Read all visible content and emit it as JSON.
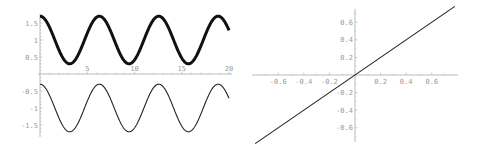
{
  "chart_data": [
    {
      "type": "line",
      "title": "",
      "xlabel": "",
      "ylabel": "",
      "xlim": [
        0,
        20
      ],
      "ylim": [
        -1.75,
        1.75
      ],
      "grid": false,
      "x_ticks": [
        "5",
        "10",
        "15",
        "20"
      ],
      "y_ticks": [
        "1.5",
        "1",
        "0.5",
        "-0.5",
        "-1",
        "-1.5"
      ],
      "series": [
        {
          "name": "upper (thick)",
          "function": "1 + 0.7*cos(x)",
          "x": [
            0,
            3.14,
            6.28,
            9.42,
            12.57,
            15.71,
            18.85,
            20
          ],
          "values": [
            1.7,
            0.3,
            1.7,
            0.3,
            1.7,
            0.3,
            1.7,
            1.29
          ]
        },
        {
          "name": "lower (thin)",
          "function": "-1 + 0.7*cos(x)",
          "x": [
            0,
            3.14,
            6.28,
            9.42,
            12.57,
            15.71,
            18.85,
            20
          ],
          "values": [
            -0.3,
            -1.7,
            -0.3,
            -1.7,
            -0.3,
            -1.7,
            -0.3,
            -0.71
          ]
        }
      ]
    },
    {
      "type": "line",
      "title": "",
      "xlabel": "",
      "ylabel": "",
      "xlim": [
        -0.7,
        0.7
      ],
      "ylim": [
        -0.7,
        0.7
      ],
      "grid": false,
      "x_ticks": [
        "-0.6",
        "-0.4",
        "-0.2",
        "0.2",
        "0.4",
        "0.6"
      ],
      "y_ticks": [
        "0.6",
        "0.4",
        "0.2",
        "-0.2",
        "-0.4",
        "-0.6"
      ],
      "series": [
        {
          "name": "y = x",
          "x": [
            -0.7,
            0,
            0.7
          ],
          "values": [
            -0.7,
            0,
            0.7
          ]
        }
      ]
    }
  ],
  "left": {
    "x_ticks": [
      {
        "v": 5,
        "l": "5"
      },
      {
        "v": 10,
        "l": "10"
      },
      {
        "v": 15,
        "l": "15"
      },
      {
        "v": 20,
        "l": "20"
      }
    ],
    "y_ticks": [
      {
        "v": 1.5,
        "l": "1.5"
      },
      {
        "v": 1,
        "l": "1"
      },
      {
        "v": 0.5,
        "l": "0.5"
      },
      {
        "v": -0.5,
        "l": "-0.5"
      },
      {
        "v": -1,
        "l": "-1"
      },
      {
        "v": -1.5,
        "l": "-1.5"
      }
    ]
  },
  "right": {
    "x_ticks": [
      {
        "v": -0.6,
        "l": "-0.6"
      },
      {
        "v": -0.4,
        "l": "-0.4"
      },
      {
        "v": -0.2,
        "l": "-0.2"
      },
      {
        "v": 0.2,
        "l": "0.2"
      },
      {
        "v": 0.4,
        "l": "0.4"
      },
      {
        "v": 0.6,
        "l": "0.6"
      }
    ],
    "y_ticks": [
      {
        "v": 0.6,
        "l": "0.6"
      },
      {
        "v": 0.4,
        "l": "0.4"
      },
      {
        "v": 0.2,
        "l": "0.2"
      },
      {
        "v": -0.2,
        "l": "-0.2"
      },
      {
        "v": -0.4,
        "l": "-0.4"
      },
      {
        "v": -0.6,
        "l": "-0.6"
      }
    ]
  }
}
